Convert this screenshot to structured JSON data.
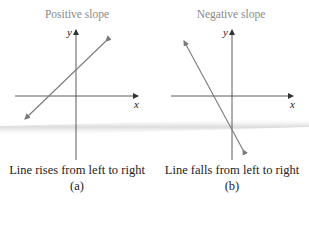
{
  "panels": [
    {
      "id": "a",
      "title": "Positive slope",
      "caption": "Line rises from left to right",
      "label": "(a)",
      "x_axis_label": "x",
      "y_axis_label": "y",
      "line": {
        "from": [
          25,
          119
        ],
        "to": [
          106,
          41
        ]
      }
    },
    {
      "id": "b",
      "title": "Negative slope",
      "caption": "Line falls from left to right",
      "label": "(b)",
      "x_axis_label": "x",
      "y_axis_label": "y",
      "line": {
        "from": [
          184,
          41
        ],
        "to": [
          243,
          150
        ]
      }
    }
  ],
  "colors": {
    "line": "#7a7a7a",
    "axis": "#333333",
    "title": "#8a8a8a",
    "band": "#e6e6e6"
  }
}
